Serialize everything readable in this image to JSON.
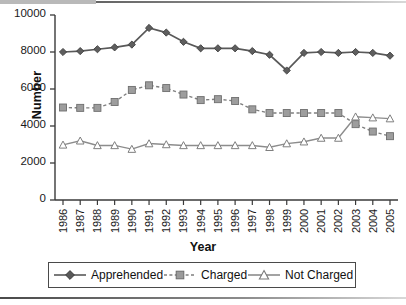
{
  "chart_data": {
    "type": "line",
    "title": "",
    "xlabel": "Year",
    "ylabel": "Number",
    "ylim": [
      0,
      10000
    ],
    "yticks": [
      0,
      2000,
      4000,
      6000,
      8000,
      10000
    ],
    "ytick_labels": [
      "0",
      "2000",
      "4000",
      "6000",
      "8000",
      "10000"
    ],
    "grid": false,
    "legend_position": "bottom",
    "categories": [
      "1986",
      "1987",
      "1988",
      "1989",
      "1990",
      "1991",
      "1992",
      "1993",
      "1994",
      "1995",
      "1996",
      "1997",
      "1998",
      "1999",
      "2000",
      "2001",
      "2002",
      "2003",
      "2004",
      "2005"
    ],
    "series": [
      {
        "name": "Apprehended",
        "marker": "diamond",
        "linestyle": "solid",
        "color": "#595959",
        "values": [
          8000,
          8050,
          8150,
          8250,
          8400,
          9300,
          9050,
          8550,
          8200,
          8200,
          8200,
          8050,
          7850,
          7000,
          7950,
          8000,
          7950,
          8000,
          7950,
          7800
        ]
      },
      {
        "name": "Charged",
        "marker": "square",
        "linestyle": "dashed",
        "color": "#7f7f7f",
        "values": [
          5000,
          4980,
          4980,
          5300,
          5950,
          6200,
          6050,
          5700,
          5400,
          5450,
          5350,
          4900,
          4700,
          4700,
          4700,
          4700,
          4700,
          4100,
          3700,
          3450
        ]
      },
      {
        "name": "Not Charged",
        "marker": "triangle",
        "linestyle": "solid",
        "color": "#8c8c8c",
        "values": [
          2980,
          3200,
          2950,
          2950,
          2750,
          3050,
          3000,
          2950,
          2950,
          2950,
          2950,
          2950,
          2850,
          3050,
          3150,
          3350,
          3350,
          4500,
          4450,
          4400
        ]
      }
    ]
  },
  "legend": {
    "items": [
      {
        "label": "Apprehended"
      },
      {
        "label": "Charged"
      },
      {
        "label": "Not Charged"
      }
    ]
  },
  "axes": {
    "y_title": "Number",
    "x_title": "Year"
  }
}
